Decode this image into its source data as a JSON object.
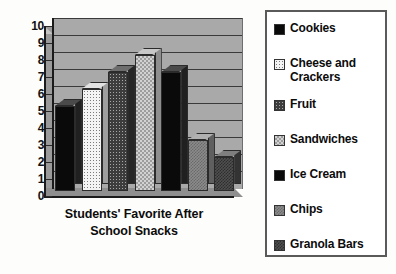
{
  "chart_data": {
    "type": "bar",
    "title": "Students' Favorite After School Snacks",
    "title_line1": "Students' Favorite After",
    "title_line2": "School Snacks",
    "xlabel": "",
    "ylabel": "",
    "ylim": [
      0,
      10
    ],
    "ytick_values": [
      "10",
      "9",
      "8",
      "7",
      "6",
      "5",
      "4",
      "3",
      "2",
      "1",
      "0"
    ],
    "grid": true,
    "grid_orientation": "horizontal",
    "legend_position": "right",
    "style": "3d-column",
    "categories": [
      "Cookies",
      "Cheese and Crackers",
      "Fruit",
      "Sandwiches",
      "Ice Cream",
      "Chips",
      "Granola Bars"
    ],
    "values": [
      5,
      6,
      7,
      8,
      7,
      3,
      2
    ],
    "bars": [
      {
        "label": "Cookies",
        "value": 5,
        "pattern": "solid-black",
        "color": "#0a0a0a"
      },
      {
        "label": "Cheese and Crackers",
        "value": 6,
        "pattern": "white-dots",
        "color": "#f4f4f4"
      },
      {
        "label": "Fruit",
        "value": 7,
        "pattern": "dark-dots",
        "color": "#3d3d3d"
      },
      {
        "label": "Sandwiches",
        "value": 8,
        "pattern": "light-weave",
        "color": "#d2d2d2"
      },
      {
        "label": "Ice Cream",
        "value": 7,
        "pattern": "solid-black",
        "color": "#0d0d0d"
      },
      {
        "label": "Chips",
        "value": 3,
        "pattern": "mid-gray",
        "color": "#8b8b8b"
      },
      {
        "label": "Granola Bars",
        "value": 2,
        "pattern": "dark-gray",
        "color": "#4f4f4f"
      }
    ],
    "plot_background": "#a9a9a9",
    "gridline_color": "#3a3a3a",
    "axis_color": "#1b1b1b"
  },
  "legend": {
    "items": [
      {
        "label": "Cookies"
      },
      {
        "label": "Cheese and Crackers"
      },
      {
        "label": "Fruit"
      },
      {
        "label": "Sandwiches"
      },
      {
        "label": "Ice Cream"
      },
      {
        "label": "Chips"
      },
      {
        "label": "Granola Bars"
      }
    ]
  }
}
